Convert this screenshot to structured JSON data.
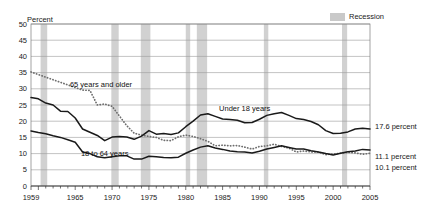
{
  "legend": {
    "recession_label": "Recession",
    "recession_color": "#c9c9c9"
  },
  "axes": {
    "ylabel": "Percent",
    "yticks": [
      "0",
      "5",
      "10",
      "15",
      "20",
      "25",
      "30",
      "35",
      "40",
      "45",
      "50"
    ],
    "ylim": [
      0,
      50
    ],
    "xticks": [
      "1959",
      "1965",
      "1970",
      "1975",
      "1980",
      "1985",
      "1990",
      "1995",
      "2000",
      "2005"
    ],
    "xlim": [
      1959,
      2005
    ],
    "grid": true
  },
  "series_labels": {
    "older": "65 years and older",
    "under18": "Under 18 years",
    "adults": "18 to 64 years"
  },
  "end_labels": {
    "under18": "17.6 percent",
    "adults": "11.1 percent",
    "older": "10.1 percent"
  },
  "chart_data": {
    "type": "line",
    "title": "",
    "xlabel": "",
    "ylabel": "Percent",
    "ylim": [
      0,
      50
    ],
    "xlim": [
      1959,
      2005
    ],
    "grid": true,
    "legend_position": "top-right",
    "annotations": [
      {
        "text": "65 years and older",
        "x": 1968.5,
        "y": 30.5
      },
      {
        "text": "Under 18 years",
        "x": 1988.0,
        "y": 23.0
      },
      {
        "text": "18 to 64 years",
        "x": 1969.0,
        "y": 9.2
      }
    ],
    "recessions": [
      {
        "start": 1960.3,
        "end": 1961.2
      },
      {
        "start": 1969.9,
        "end": 1970.9
      },
      {
        "start": 1973.9,
        "end": 1975.2
      },
      {
        "start": 1980.0,
        "end": 1980.6
      },
      {
        "start": 1981.5,
        "end": 1982.9
      },
      {
        "start": 1990.6,
        "end": 1991.2
      },
      {
        "start": 2001.2,
        "end": 2001.9
      }
    ],
    "x": [
      1959,
      1960,
      1961,
      1962,
      1963,
      1964,
      1965,
      1966,
      1967,
      1968,
      1969,
      1970,
      1971,
      1972,
      1973,
      1974,
      1975,
      1976,
      1977,
      1978,
      1979,
      1980,
      1981,
      1982,
      1983,
      1984,
      1985,
      1986,
      1987,
      1988,
      1989,
      1990,
      1991,
      1992,
      1993,
      1994,
      1995,
      1996,
      1997,
      1998,
      1999,
      2000,
      2001,
      2002,
      2003,
      2004,
      2005
    ],
    "series": [
      {
        "name": "65 years and older",
        "style": "dotted",
        "color": "#6e6e6e",
        "values": [
          35.2,
          34.4,
          33.6,
          32.8,
          32.0,
          31.2,
          30.4,
          29.6,
          29.5,
          25.0,
          25.3,
          24.6,
          21.6,
          18.6,
          16.3,
          15.7,
          15.3,
          15.0,
          14.1,
          14.0,
          15.2,
          15.7,
          15.3,
          14.6,
          13.8,
          12.4,
          12.6,
          12.4,
          12.5,
          12.0,
          11.4,
          12.2,
          12.4,
          12.9,
          12.2,
          11.7,
          10.5,
          10.8,
          10.5,
          10.5,
          9.7,
          9.9,
          10.1,
          10.4,
          10.2,
          9.8,
          10.1
        ]
      },
      {
        "name": "Under 18 years",
        "style": "solid",
        "color": "#1a1a1a",
        "values": [
          27.3,
          26.9,
          25.6,
          25.0,
          23.1,
          23.0,
          21.0,
          17.6,
          16.6,
          15.6,
          14.0,
          15.1,
          15.3,
          15.1,
          14.4,
          15.4,
          17.1,
          16.0,
          16.2,
          15.9,
          16.4,
          18.3,
          20.0,
          21.9,
          22.3,
          21.5,
          20.7,
          20.5,
          20.3,
          19.5,
          19.6,
          20.6,
          21.8,
          22.3,
          22.7,
          21.8,
          20.8,
          20.5,
          19.9,
          18.9,
          17.1,
          16.2,
          16.3,
          16.7,
          17.6,
          17.8,
          17.6
        ]
      },
      {
        "name": "18 to 64 years",
        "style": "solid",
        "color": "#1a1a1a",
        "values": [
          17.0,
          16.5,
          16.1,
          15.5,
          15.0,
          14.3,
          13.5,
          10.5,
          10.0,
          9.0,
          8.7,
          9.0,
          9.3,
          9.3,
          8.3,
          8.3,
          9.2,
          9.0,
          8.8,
          8.7,
          8.9,
          10.1,
          11.1,
          12.0,
          12.4,
          11.7,
          11.3,
          10.8,
          10.6,
          10.5,
          10.2,
          10.7,
          11.4,
          11.9,
          12.4,
          11.9,
          11.4,
          11.4,
          10.9,
          10.5,
          10.0,
          9.6,
          10.1,
          10.6,
          10.8,
          11.3,
          11.1
        ]
      }
    ]
  }
}
